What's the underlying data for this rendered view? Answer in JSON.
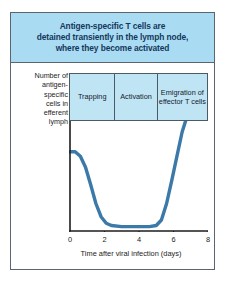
{
  "figure": {
    "title_lines": [
      "Antigen-specific T cells are",
      "detained transiently in the lymph node,",
      "where they become activated"
    ],
    "colors": {
      "banner_background": "#a9dcf2",
      "phase_background": "#bfe5f5",
      "title_text": "#15375c",
      "curve": "#3a79a8",
      "axis": "#1c1c1c",
      "frame_border": "#5a6570"
    }
  },
  "phases": [
    {
      "label": "Trapping"
    },
    {
      "label": "Activation"
    },
    {
      "label": "Emigration of effector T cells"
    }
  ],
  "chart_data": {
    "type": "line",
    "title": "Antigen-specific T cells are detained transiently in the lymph node, where they become activated",
    "xlabel": "Time after viral infection (days)",
    "ylabel": "Number of antigen-specific cells in efferent lymph",
    "xlim": [
      0,
      8
    ],
    "ylim": [
      0,
      1
    ],
    "xticks": [
      0,
      2,
      4,
      6,
      8
    ],
    "xticklabels": [
      "0",
      "2",
      "4",
      "6",
      "8"
    ],
    "yticks": [],
    "yticklabels": [],
    "grid": false,
    "legend": null,
    "series": [
      {
        "name": "Antigen-specific cells in efferent lymph",
        "color": "#3a79a8",
        "x": [
          0.0,
          0.3,
          0.6,
          0.9,
          1.2,
          1.5,
          1.8,
          2.1,
          2.4,
          3.0,
          3.6,
          4.2,
          4.6,
          5.0,
          5.3,
          5.6,
          5.9,
          6.2,
          6.5,
          6.7
        ],
        "values": [
          0.72,
          0.72,
          0.68,
          0.58,
          0.42,
          0.25,
          0.13,
          0.07,
          0.05,
          0.04,
          0.04,
          0.04,
          0.04,
          0.05,
          0.1,
          0.25,
          0.46,
          0.68,
          0.9,
          1.0
        ]
      }
    ],
    "annotations": [
      {
        "label": "Trapping",
        "x_start": 0.0,
        "x_end": 2.6
      },
      {
        "label": "Activation",
        "x_start": 2.6,
        "x_end": 5.0
      },
      {
        "label": "Emigration of effector T cells",
        "x_start": 5.0,
        "x_end": 8.0
      }
    ]
  },
  "y_axis_caption_lines": [
    "Number of",
    "antigen-",
    "specific",
    "cells in",
    "efferent",
    "lymph"
  ],
  "x_axis": {
    "title": "Time after viral infection (days)",
    "ticks": [
      "0",
      "2",
      "4",
      "6",
      "8"
    ]
  }
}
